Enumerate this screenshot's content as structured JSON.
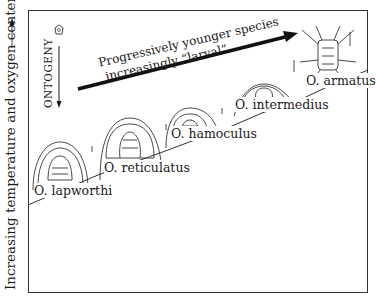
{
  "figure": {
    "y_axis_label": "Increasing temperature and oxygen content",
    "ontogeny_label": "ONTOGENY",
    "trend_arrow": {
      "line1": "Progressively younger species",
      "line2": "increasingly “larval”"
    },
    "species": [
      {
        "name": "O. lapworthi"
      },
      {
        "name": "O. reticulatus"
      },
      {
        "name": "O. hamoculus"
      },
      {
        "name": "O. intermedius"
      },
      {
        "name": "O. armatus"
      }
    ],
    "colors": {
      "line": "#1a1a1a",
      "background": "#ffffff"
    }
  }
}
